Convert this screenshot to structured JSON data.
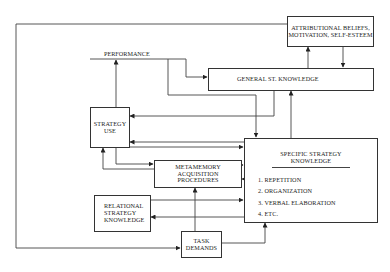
{
  "diagram": {
    "nodes": {
      "attributional": {
        "label": "ATTRIBUTIONAL BELIEFS, MOTIVATION, SELF-ESTEEM",
        "line1": "ATTRIBUTIONAL BELIEFS,",
        "line2": "MOTIVATION, SELF-ESTEEM"
      },
      "general_knowledge": {
        "label": "GENERAL ST. KNOWLEDGE"
      },
      "performance": {
        "label": "PERFORMANCE"
      },
      "strategy_use": {
        "label": "STRATEGY USE",
        "line1": "STRATEGY",
        "line2": "USE"
      },
      "metamemory": {
        "label": "METAMEMORY ACQUISITION PROCEDURES",
        "line1": "METAMEMORY",
        "line2": "ACQUISITION",
        "line3": "PROCEDURES"
      },
      "specific_knowledge": {
        "title_line1": "SPECIFIC STRATEGY",
        "title_line2": "KNOWLEDGE",
        "items": [
          "1.  REPETITION",
          "2.  ORGANIZATION",
          "3.  VERBAL ELABORATION",
          "4.  ETC."
        ]
      },
      "relational": {
        "label": "RELATIONAL STRATEGY KNOWLEDGE",
        "line1": "RELATIONAL",
        "line2": "STRATEGY",
        "line3": "KNOWLEDGE"
      },
      "task_demands": {
        "label": "TASK DEMANDS",
        "line1": "TASK",
        "line2": "DEMANDS"
      }
    },
    "edges": [
      {
        "from": "attributional",
        "to": "general_knowledge"
      },
      {
        "from": "general_knowledge",
        "to": "attributional"
      },
      {
        "from": "performance",
        "to": "general_knowledge"
      },
      {
        "from": "performance",
        "to": "specific_knowledge"
      },
      {
        "from": "strategy_use",
        "to": "performance"
      },
      {
        "from": "general_knowledge",
        "to": "strategy_use"
      },
      {
        "from": "specific_knowledge",
        "to": "general_knowledge"
      },
      {
        "from": "specific_knowledge",
        "to": "strategy_use"
      },
      {
        "from": "strategy_use",
        "to": "specific_knowledge"
      },
      {
        "from": "strategy_use",
        "to": "metamemory"
      },
      {
        "from": "metamemory",
        "to": "strategy_use"
      },
      {
        "from": "metamemory",
        "to": "specific_knowledge"
      },
      {
        "from": "specific_knowledge",
        "to": "metamemory"
      },
      {
        "from": "relational",
        "to": "specific_knowledge"
      },
      {
        "from": "specific_knowledge",
        "to": "relational"
      },
      {
        "from": "task_demands",
        "to": "metamemory"
      },
      {
        "from": "task_demands",
        "to": "specific_knowledge"
      },
      {
        "from": "attributional",
        "to": "task_demands"
      }
    ]
  }
}
